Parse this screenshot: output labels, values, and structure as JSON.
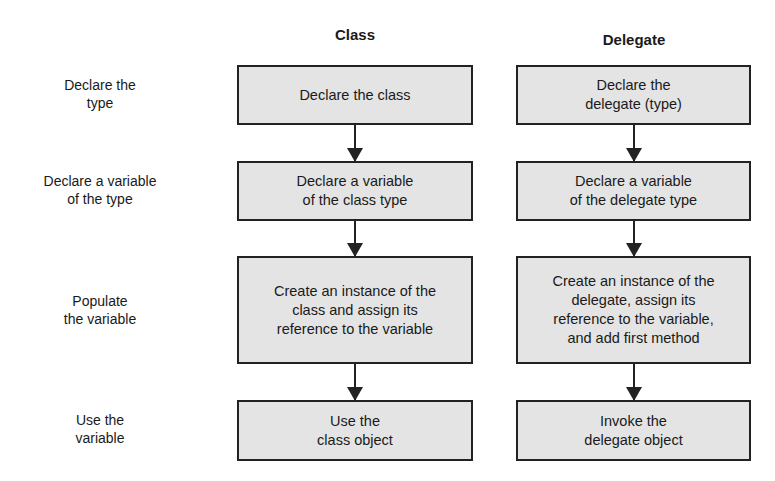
{
  "headers": {
    "class": "Class",
    "delegate": "Delegate"
  },
  "rows": [
    {
      "label": "Declare the\ntype",
      "class": "Declare the class",
      "delegate": "Declare the\ndelegate (type)"
    },
    {
      "label": "Declare a variable\nof the type",
      "class": "Declare a variable\nof the class type",
      "delegate": "Declare a variable\nof the delegate type"
    },
    {
      "label": "Populate\nthe variable",
      "class": "Create an instance of the\nclass and assign its\nreference to the variable",
      "delegate": "Create an instance of the\ndelegate, assign its\nreference to the variable,\nand add first method"
    },
    {
      "label": "Use the\nvariable",
      "class": "Use the\nclass object",
      "delegate": "Invoke the\ndelegate object"
    }
  ]
}
